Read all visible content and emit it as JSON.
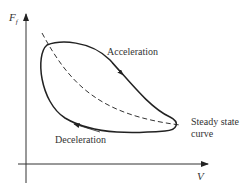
{
  "diagram": {
    "y_axis_label": "F",
    "y_axis_subscript": "f",
    "x_axis_label": "V",
    "labels": {
      "acceleration": "Acceleration",
      "deceleration": "Deceleration",
      "steady_line1": "Steady state",
      "steady_line2": "curve"
    },
    "colors": {
      "stroke": "#222222",
      "text": "#333333",
      "background": "#ffffff"
    }
  }
}
